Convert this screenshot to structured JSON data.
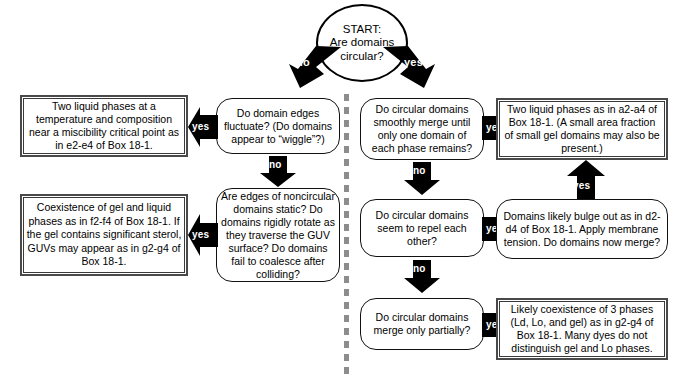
{
  "diagram": {
    "divider": {
      "name": "vertical-dashed-divider",
      "color": "#8d8d8d",
      "style": "dashed"
    },
    "nodes": {
      "start": {
        "id": "start",
        "shape": "circle",
        "text": "START:\nAre domains\ncircular?",
        "lines": [
          "START:",
          "Are domains",
          "circular?"
        ]
      },
      "q_fluctuate": {
        "id": "q-domain-edges-fluctuate",
        "shape": "rounded",
        "text": "Do domain edges fluctuate? (Do domains appear to “wiggle”?)"
      },
      "r_two_liquid_critical": {
        "id": "result-two-liquid-phases-critical-point",
        "shape": "rect",
        "text": "Two liquid phases at a temperature and composition near a miscibility critical point as in e2-e4 of Box 18-1."
      },
      "q_noncircular_static": {
        "id": "q-noncircular-domains-static",
        "shape": "rounded",
        "text": "Are edges of noncircular domains static? Do domains rigidly rotate as they traverse the GUV surface? Do domains fail to coalesce after colliding?"
      },
      "r_gel_liquid": {
        "id": "result-coexistence-gel-and-liquid",
        "shape": "rect",
        "text": "Coexistence of gel and liquid phases as in f2-f4 of Box 18-1. If the gel contains significant sterol, GUVs may appear as in g2-g4 of Box 18-1."
      },
      "q_smooth_merge": {
        "id": "q-circular-domains-smoothly-merge",
        "shape": "rounded",
        "text": "Do circular domains smoothly merge until only one domain of each phase remains?"
      },
      "r_two_liquid_a2a4": {
        "id": "result-two-liquid-phases-a2-a4",
        "shape": "rect",
        "text": "Two liquid phases as in a2-a4 of Box 18-1. (A small area fraction of small gel domains may also be present.)"
      },
      "q_repel": {
        "id": "q-circular-domains-repel",
        "shape": "rounded",
        "text": "Do circular domains seem to repel each other?"
      },
      "q_bulge": {
        "id": "q-domains-bulge-out-apply-tension",
        "shape": "rounded",
        "text": "Domains likely bulge out as in d2-d4 of Box 18-1. Apply membrane tension. Do domains now merge?"
      },
      "q_partial_merge": {
        "id": "q-circular-domains-merge-partially",
        "shape": "rounded",
        "text": "Do circular domains merge only partially?"
      },
      "r_three_phases": {
        "id": "result-three-phase-coexistence",
        "shape": "rect",
        "text": "Likely coexistence of 3 phases (Ld, Lo, and gel) as in g2-g4 of Box 18-1. Many dyes do not distinguish gel and Lo phases."
      }
    },
    "edges": [
      {
        "id": "start-no",
        "label": "no",
        "from": "start",
        "to": "q_fluctuate",
        "direction": "down-left-bent"
      },
      {
        "id": "start-yes",
        "label": "yes",
        "from": "start",
        "to": "q_smooth_merge",
        "direction": "down-right-bent"
      },
      {
        "id": "fluctuate-yes",
        "label": "yes",
        "from": "q_fluctuate",
        "to": "r_two_liquid_critical",
        "direction": "left"
      },
      {
        "id": "fluctuate-no",
        "label": "no",
        "from": "q_fluctuate",
        "to": "q_noncircular_static",
        "direction": "down"
      },
      {
        "id": "noncircular-yes",
        "label": "yes",
        "from": "q_noncircular_static",
        "to": "r_gel_liquid",
        "direction": "left"
      },
      {
        "id": "smoothmerge-yes",
        "label": "yes",
        "from": "q_smooth_merge",
        "to": "r_two_liquid_a2a4",
        "direction": "right"
      },
      {
        "id": "smoothmerge-no",
        "label": "no",
        "from": "q_smooth_merge",
        "to": "q_repel",
        "direction": "down"
      },
      {
        "id": "repel-yes",
        "label": "yes",
        "from": "q_repel",
        "to": "q_bulge",
        "direction": "right"
      },
      {
        "id": "repel-no",
        "label": "no",
        "from": "q_repel",
        "to": "q_partial_merge",
        "direction": "down"
      },
      {
        "id": "bulge-yes",
        "label": "yes",
        "from": "q_bulge",
        "to": "r_two_liquid_a2a4",
        "direction": "up"
      },
      {
        "id": "partialmerge-yes",
        "label": "yes",
        "from": "q_partial_merge",
        "to": "r_three_phases",
        "direction": "right"
      }
    ]
  }
}
